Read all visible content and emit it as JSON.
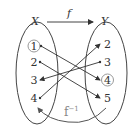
{
  "diagram": {
    "domain_label": "X",
    "codomain_label": "Y",
    "function_label": "f",
    "inverse_label": "f",
    "inverse_superscript": "−1",
    "domain_elements": [
      "1",
      "2",
      "3",
      "4"
    ],
    "codomain_elements": [
      "2",
      "3",
      "4",
      "5"
    ],
    "circled": {
      "domain": "1",
      "codomain": "4"
    },
    "mappings": [
      {
        "from": "1",
        "to": "4"
      },
      {
        "from": "2",
        "to": "5"
      },
      {
        "from": "3",
        "to": "3"
      },
      {
        "from": "4",
        "to": "2"
      }
    ],
    "colors": {
      "line": "#333333",
      "inverse": "#888888",
      "circle": "#999999"
    }
  }
}
